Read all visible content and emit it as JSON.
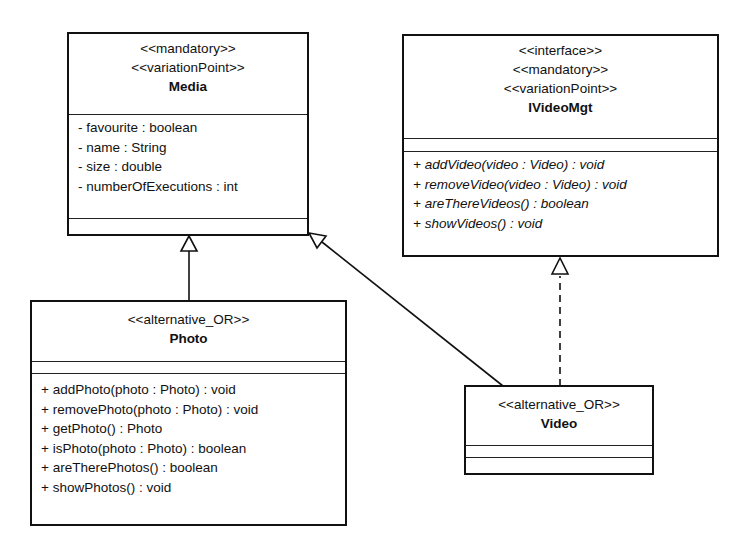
{
  "classes": {
    "media": {
      "stereotypes": [
        "<<mandatory>>",
        "<<variationPoint>>"
      ],
      "name": "Media",
      "attributes": [
        "- favourite : boolean",
        "- name : String",
        "- size : double",
        "- numberOfExecutions : int"
      ],
      "operations": []
    },
    "ivideomgt": {
      "stereotypes": [
        "<<interface>>",
        "<<mandatory>>",
        "<<variationPoint>>"
      ],
      "name": "IVideoMgt",
      "attributes": [],
      "operations": [
        "+ addVideo(video : Video) : void",
        "+ removeVideo(video : Video) : void",
        "+ areThereVideos() : boolean",
        "+ showVideos() : void"
      ]
    },
    "photo": {
      "stereotypes": [
        "<<alternative_OR>>"
      ],
      "name": "Photo",
      "attributes": [],
      "operations": [
        "+ addPhoto(photo : Photo) : void",
        "+ removePhoto(photo : Photo) : void",
        "+ getPhoto() : Photo",
        "+ isPhoto(photo : Photo) : boolean",
        "+ areTherePhotos() : boolean",
        "+ showPhotos() : void"
      ]
    },
    "video": {
      "stereotypes": [
        "<<alternative_OR>>"
      ],
      "name": "Video",
      "attributes": [],
      "operations": []
    }
  },
  "relations": [
    {
      "type": "generalization",
      "from": "Photo",
      "to": "Media"
    },
    {
      "type": "generalization",
      "from": "Video",
      "to": "Media"
    },
    {
      "type": "realization",
      "from": "Video",
      "to": "IVideoMgt"
    }
  ]
}
